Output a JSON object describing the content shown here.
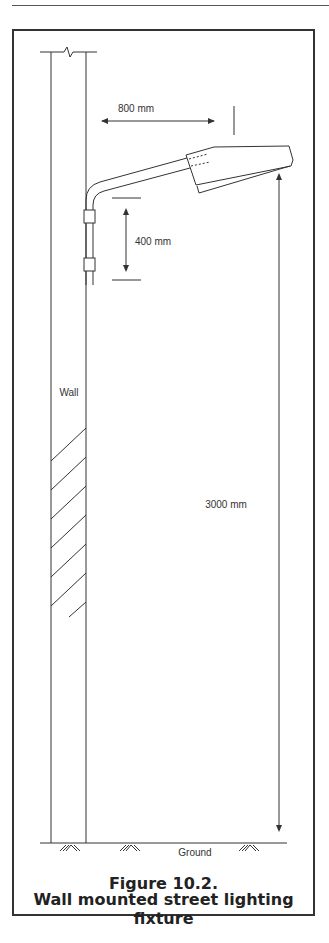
{
  "figure": {
    "number": "Figure 10.2.",
    "title": "Wall mounted street lighting fixture"
  },
  "labels": {
    "wall": "Wall",
    "ground": "Ground"
  },
  "dimensions": {
    "arm_reach": "800 mm",
    "bracket_spacing": "400 mm",
    "mounting_height": "3000 mm"
  },
  "colors": {
    "line": "#333333",
    "background": "#ffffff"
  }
}
